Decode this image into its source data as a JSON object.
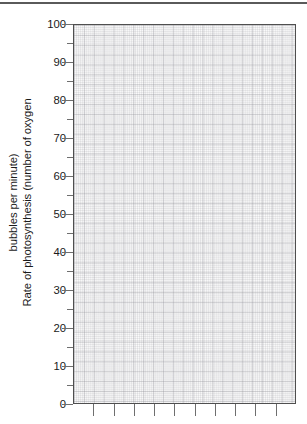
{
  "figure": {
    "top_rule_color": "#5a5a5a",
    "plot_background": "#fbfbfb",
    "axis_color": "#4f4f4f",
    "grid_major_color": "#8c8c94",
    "grid_minor_color": "#96969e",
    "text_color": "#1a1a1a"
  },
  "chart_data": {
    "type": "line",
    "title": "",
    "xlabel": "",
    "ylabel": "Rate of photosynthesis (number of oxygen bubbles per minute)",
    "ylabel_lines": [
      "Rate of photosynthesis (number of oxygen",
      "bubbles per minute)"
    ],
    "ylim": [
      0,
      100
    ],
    "y_ticks_major": [
      0,
      10,
      20,
      30,
      40,
      50,
      60,
      70,
      80,
      90,
      100
    ],
    "y_ticks_minor": [
      5,
      15,
      25,
      35,
      45,
      55,
      65,
      75,
      85,
      95
    ],
    "y_tick_labels": [
      "0",
      "10",
      "20",
      "30",
      "40",
      "50",
      "60",
      "70",
      "80",
      "90",
      "100"
    ],
    "x_tick_labels": [],
    "x_tick_count": 10,
    "grid": "graph-paper",
    "legend": null,
    "series": [],
    "values": [],
    "categories": [],
    "annotations": [],
    "note": "Blank graph-paper grid with no plotted data; axes drawn for a student to plot results."
  }
}
